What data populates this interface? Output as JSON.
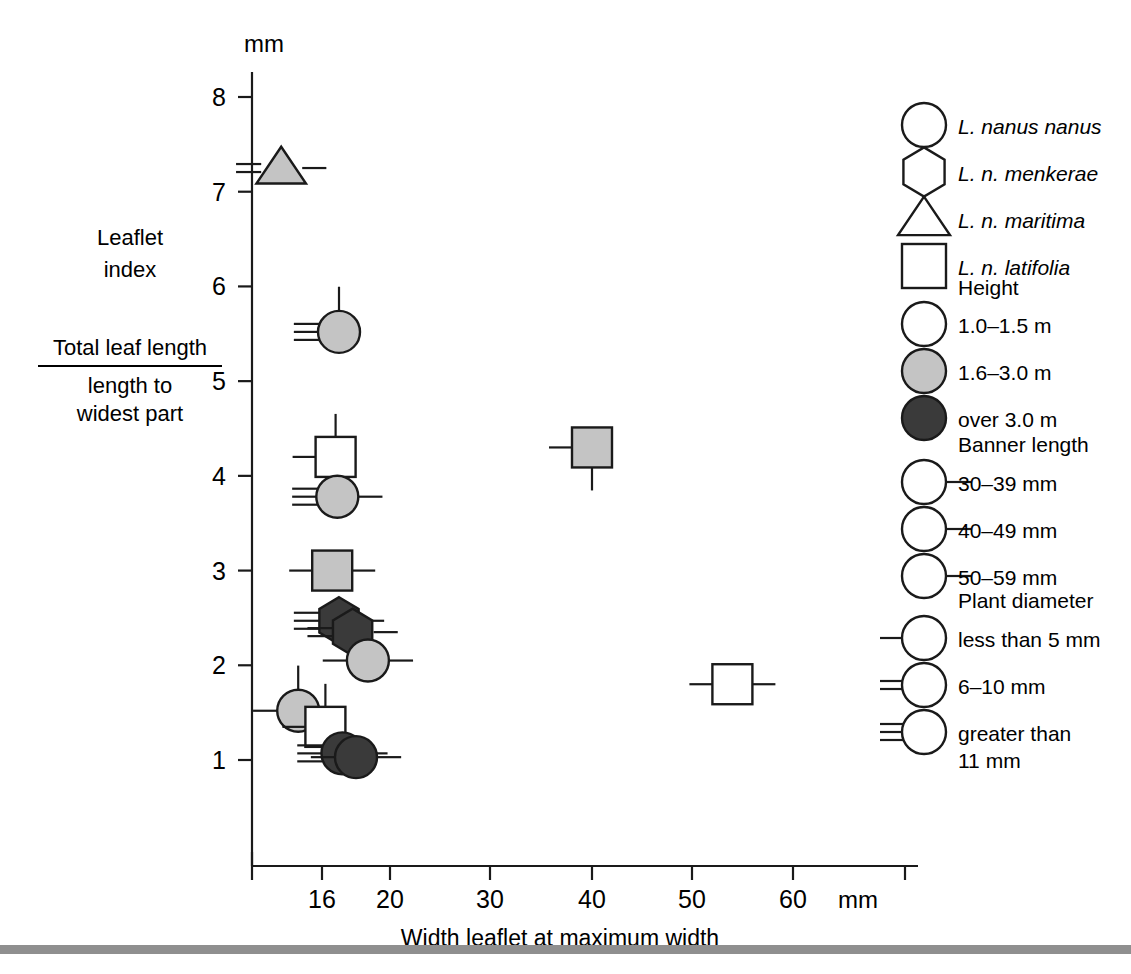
{
  "figure": {
    "y_unit_label": "mm",
    "x_unit_label": "mm",
    "x_axis_title": "Width leaflet at maximum width",
    "y_axis_title_line1": "Leaflet",
    "y_axis_title_line2": "index",
    "y_axis_fraction_numerator": "Total leaf length",
    "y_axis_fraction_denominator_line1": "length to",
    "y_axis_fraction_denominator_line2": "widest part",
    "footer_rule_color": "#8f8f8f"
  },
  "colors": {
    "ink": "#1a1a1a",
    "fill_white": "#ffffff",
    "fill_gray": "#c4c4c4",
    "fill_dark": "#3a3a3a"
  },
  "chart_data": {
    "type": "scatter",
    "title": "",
    "xlabel": "Width leaflet at maximum width",
    "ylabel": "Leaflet index (Total leaf length / length to widest part)",
    "xunit": "mm",
    "yunit": "mm",
    "xlim": [
      13,
      66
    ],
    "ylim": [
      0.4,
      8.4
    ],
    "x_ticks": [
      16,
      20,
      30,
      40,
      50,
      60
    ],
    "y_ticks": [
      1,
      2,
      3,
      4,
      5,
      6,
      7,
      8
    ],
    "grid": false,
    "legend_position": "right",
    "encoding": {
      "shape": "subspecies",
      "fill": "plant height class",
      "tick_position": "banner length class",
      "left_hash_count": "plant diameter class"
    },
    "points": [
      {
        "x": 13.6,
        "y": 7.25,
        "shape": "triangle",
        "fill": "gray",
        "banner": "40-49",
        "diameter": "6-10"
      },
      {
        "x": 17.0,
        "y": 5.52,
        "shape": "circle",
        "fill": "gray",
        "banner": "30-39",
        "diameter": "greater-than-11"
      },
      {
        "x": 16.8,
        "y": 4.2,
        "shape": "square",
        "fill": "white",
        "banner": "30-39",
        "diameter": "less-than-5"
      },
      {
        "x": 40.0,
        "y": 4.3,
        "shape": "square",
        "fill": "gray",
        "banner": "50-59",
        "diameter": "less-than-5"
      },
      {
        "x": 16.9,
        "y": 3.78,
        "shape": "circle",
        "fill": "gray",
        "banner": "40-49",
        "diameter": "greater-than-11"
      },
      {
        "x": 16.6,
        "y": 3.0,
        "shape": "square",
        "fill": "gray",
        "banner": "40-49",
        "diameter": "less-than-5"
      },
      {
        "x": 17.0,
        "y": 2.47,
        "shape": "hexagon",
        "fill": "dark",
        "banner": "40-49",
        "diameter": "greater-than-11"
      },
      {
        "x": 17.8,
        "y": 2.35,
        "shape": "hexagon",
        "fill": "dark",
        "banner": "40-49",
        "diameter": "6-10"
      },
      {
        "x": 18.7,
        "y": 2.05,
        "shape": "circle",
        "fill": "gray",
        "banner": "40-49",
        "diameter": "less-than-5"
      },
      {
        "x": 54.0,
        "y": 1.8,
        "shape": "square",
        "fill": "white",
        "banner": "40-49",
        "diameter": "less-than-5"
      },
      {
        "x": 14.6,
        "y": 1.52,
        "shape": "circle",
        "fill": "gray",
        "banner": "30-39",
        "diameter": "less-than-5"
      },
      {
        "x": 16.2,
        "y": 1.35,
        "shape": "square",
        "fill": "white",
        "banner": "30-39",
        "diameter": "less-than-5"
      },
      {
        "x": 17.2,
        "y": 1.07,
        "shape": "circle",
        "fill": "dark",
        "banner": "40-49",
        "diameter": "greater-than-11"
      },
      {
        "x": 18.0,
        "y": 1.03,
        "shape": "circle",
        "fill": "dark",
        "banner": "40-49",
        "diameter": "less-than-5"
      }
    ]
  },
  "legend": {
    "taxa": [
      {
        "symbol": "circle",
        "label": "L. nanus nanus"
      },
      {
        "symbol": "hexagon",
        "label": "L. n. menkerae"
      },
      {
        "symbol": "triangle",
        "label": "L. n. maritima"
      },
      {
        "symbol": "square",
        "label": "L. n. latifolia"
      }
    ],
    "height": {
      "title": "Height",
      "items": [
        {
          "fill": "white",
          "label": "1.0–1.5 m"
        },
        {
          "fill": "gray",
          "label": "1.6–3.0 m"
        },
        {
          "fill": "dark",
          "label": "over 3.0 m"
        }
      ]
    },
    "banner": {
      "title": "Banner length",
      "items": [
        {
          "tick": "top",
          "label": "30–39 mm"
        },
        {
          "tick": "right",
          "label": "40–49 mm"
        },
        {
          "tick": "bottom",
          "label": "50–59 mm"
        }
      ]
    },
    "diameter": {
      "title": "Plant diameter",
      "items": [
        {
          "hashes": 1,
          "label": "less than 5 mm"
        },
        {
          "hashes": 2,
          "label": "6–10 mm"
        },
        {
          "hashes": 3,
          "label": "greater than",
          "label2": "11 mm"
        }
      ]
    }
  }
}
